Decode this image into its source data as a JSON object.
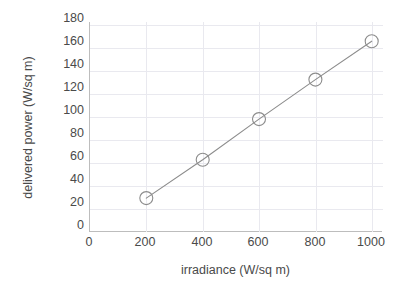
{
  "chart_data": {
    "type": "line",
    "title": "",
    "xlabel": "irradiance (W/sq m)",
    "ylabel": "delivered power (W/sq m)",
    "x": [
      200,
      400,
      600,
      800,
      1000
    ],
    "values": [
      30,
      64,
      100,
      135,
      169
    ],
    "series": [
      {
        "name": "delivered power",
        "x": [
          200,
          400,
          600,
          800,
          1000
        ],
        "values": [
          30,
          64,
          100,
          135,
          169
        ]
      }
    ],
    "xlim": [
      0,
      1040
    ],
    "ylim": [
      0,
      186
    ],
    "xticks": [
      0,
      200,
      400,
      600,
      800,
      1000
    ],
    "yticks": [
      0,
      20,
      40,
      60,
      80,
      100,
      120,
      140,
      160,
      180
    ],
    "xtick_labels": [
      "0",
      "200",
      "400",
      "600",
      "800",
      "1000"
    ],
    "ytick_labels": [
      "0",
      "20",
      "40",
      "60",
      "80",
      "100",
      "120",
      "140",
      "160",
      "180"
    ],
    "grid": true,
    "grid_color": "#e9e9ef",
    "legend": null,
    "marker": "circle-open",
    "line_color": "#8c8c8c",
    "marker_color": "#8c8c8c",
    "axis_color": "#bdbdbd",
    "text_color": "#4a4a4a",
    "background": "#ffffff"
  }
}
